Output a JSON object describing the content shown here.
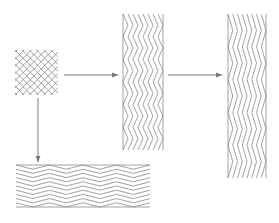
{
  "diagram": {
    "type": "mesh-deformation",
    "colors": {
      "line": "#8a8a8a",
      "arrow": "#7a7a7a",
      "background": "#ffffff"
    },
    "meshes": [
      {
        "name": "square-diamond-mesh",
        "x": 15,
        "y": 50,
        "w": 43,
        "h": 45,
        "cols": 6,
        "rows": 6,
        "shape": "grid"
      },
      {
        "name": "vertical-stretched-mesh",
        "x": 123,
        "y": 14,
        "w": 40,
        "h": 136,
        "cols": 4,
        "rows": 6,
        "shape": "zigzag"
      },
      {
        "name": "vertical-elongated-mesh",
        "x": 228,
        "y": 14,
        "w": 38,
        "h": 164,
        "cols": 4,
        "rows": 5,
        "shape": "zigzag"
      },
      {
        "name": "horizontal-stretched-mesh",
        "x": 16,
        "y": 165,
        "w": 134,
        "h": 42,
        "cols": 4,
        "rows": 5,
        "shape": "hzigzag"
      }
    ],
    "arrows": [
      {
        "name": "arrow-right-1",
        "x1": 64,
        "y1": 75,
        "x2": 118,
        "y2": 75
      },
      {
        "name": "arrow-right-2",
        "x1": 168,
        "y1": 75,
        "x2": 222,
        "y2": 75
      },
      {
        "name": "arrow-down",
        "x1": 38,
        "y1": 98,
        "x2": 38,
        "y2": 162
      }
    ]
  }
}
